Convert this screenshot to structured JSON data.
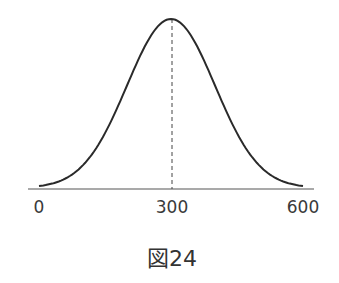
{
  "chart_data": {
    "type": "line",
    "title": "",
    "caption": "図24",
    "xlabel": "",
    "ylabel": "",
    "x_ticks": [
      "0",
      "300",
      "600"
    ],
    "xlim": [
      0,
      600
    ],
    "grid": false,
    "legend": null,
    "series": [
      {
        "name": "normal distribution curve",
        "shape": "bell curve (normal distribution)",
        "mean": 300,
        "approx_sd": 100,
        "x": [
          0,
          100,
          200,
          300,
          400,
          500,
          600
        ],
        "relative_y": [
          0.01,
          0.14,
          0.61,
          1.0,
          0.61,
          0.14,
          0.01
        ]
      }
    ],
    "annotations": [
      {
        "type": "dashed-vertical-line",
        "x": 300,
        "description": "mean marker"
      }
    ]
  },
  "axis": {
    "ticks": [
      {
        "label": "0",
        "x": 39
      },
      {
        "label": "300",
        "x": 172
      },
      {
        "label": "600",
        "x": 303
      }
    ]
  },
  "caption": "図24",
  "colors": {
    "curve": "#2a2a2a",
    "axis": "#555555",
    "text": "#3a3a3a"
  }
}
